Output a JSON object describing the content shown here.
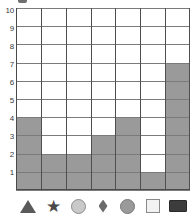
{
  "chart_data": {
    "type": "bar",
    "title": "",
    "xlabel": "",
    "ylabel": "",
    "ylim": [
      0,
      10
    ],
    "grid": true,
    "legend": "none",
    "categories": [
      "triangle",
      "star",
      "circle-light",
      "diamond",
      "circle-gray",
      "square-white",
      "rect-dark"
    ],
    "category_icons": [
      "triangle-icon",
      "star-icon",
      "circle-light-icon",
      "diamond-icon",
      "circle-gray-icon",
      "square-white-icon",
      "rect-dark-icon"
    ],
    "values": [
      4,
      2,
      2,
      3,
      4,
      1,
      7
    ],
    "y_ticks": [
      1,
      2,
      3,
      4,
      5,
      6,
      7,
      8,
      9,
      10
    ],
    "y_tick_labels": [
      "1",
      "2",
      "3",
      "4",
      "5",
      "6",
      "7",
      "8",
      "9",
      "10"
    ],
    "colors": {
      "bar_fill": "#9a9a9a",
      "grid_line": "#7b7b7b",
      "vertical_grid_line": "#4f4f4f",
      "axis": "#4a4a4a",
      "background": "#ffffff",
      "tick_label": "#3a3a3a"
    }
  },
  "axis": {
    "y_labels": [
      "10",
      "9",
      "8",
      "7",
      "6",
      "5",
      "4",
      "3",
      "2",
      "1"
    ]
  }
}
